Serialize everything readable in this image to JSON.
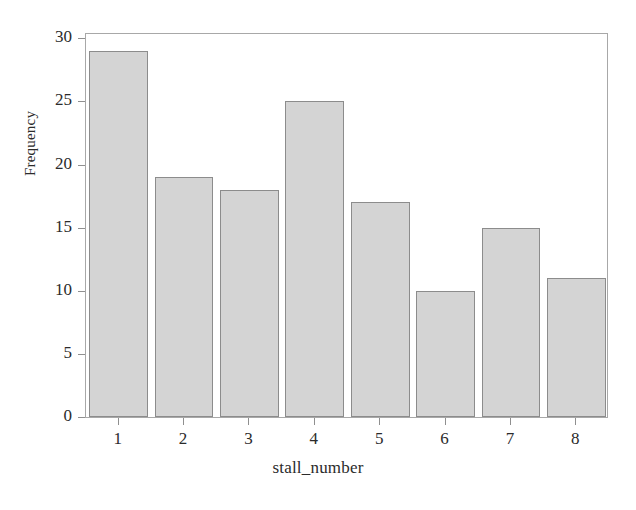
{
  "chart_data": {
    "type": "bar",
    "title": "",
    "subtitle": "",
    "xlabel": "stall_number",
    "ylabel": "Frequency",
    "categories": [
      "1",
      "2",
      "3",
      "4",
      "5",
      "6",
      "7",
      "8"
    ],
    "values": [
      29,
      19,
      18,
      25,
      17,
      10,
      15,
      11
    ],
    "series": [
      {
        "name": "Frequency",
        "values": [
          29,
          19,
          18,
          25,
          17,
          10,
          15,
          11
        ]
      }
    ],
    "xlim": [
      0.5,
      8.5
    ],
    "ylim": [
      0,
      30.5
    ],
    "yticks": [
      0,
      5,
      10,
      15,
      20,
      25,
      30
    ],
    "ytick_labels": [
      "0",
      "5",
      "10",
      "15",
      "20",
      "25",
      "30"
    ],
    "xticks": [
      1,
      2,
      3,
      4,
      5,
      6,
      7,
      8
    ],
    "xtick_labels": [
      "1",
      "2",
      "3",
      "4",
      "5",
      "6",
      "7",
      "8"
    ],
    "grid": false,
    "legend": false,
    "legend_position": "none",
    "annotations": [],
    "colors": {
      "bar_fill": "#d4d4d4",
      "bar_edge": "#8c8c8c",
      "frame": "#a8a8a8",
      "tick": "#8f8f8f",
      "text": "#2b2b2b",
      "background": "#ffffff"
    }
  }
}
